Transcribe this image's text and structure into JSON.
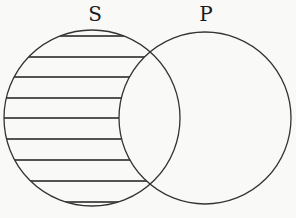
{
  "diagram": {
    "type": "venn",
    "sets": [
      {
        "name": "S",
        "label": "S",
        "cx": 92,
        "cy": 118,
        "r": 88,
        "label_x": 95,
        "label_y": 21
      },
      {
        "name": "P",
        "label": "P",
        "cx": 205,
        "cy": 118,
        "r": 86,
        "label_x": 206,
        "label_y": 21
      }
    ],
    "shaded_region": "S minus P",
    "shading_style": "horizontal-lines",
    "hatch_y": [
      36,
      57,
      77,
      98,
      118,
      139,
      160,
      181,
      202
    ],
    "colors": {
      "stroke": "#333333",
      "background": "#f9f9f7"
    }
  }
}
